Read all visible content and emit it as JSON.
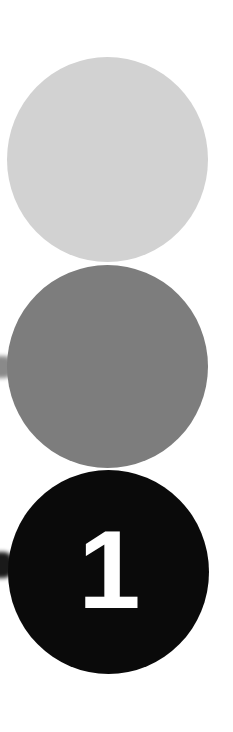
{
  "steps": [
    {
      "id": "step-light",
      "label": "",
      "color": "#d2d2d2"
    },
    {
      "id": "step-mid",
      "label": "",
      "color": "#7d7d7d"
    },
    {
      "id": "step-dark",
      "label": "1",
      "color": "#0a0a0a"
    }
  ],
  "connectors": [
    {
      "id": "connector-mid",
      "color": "#8a8a8a"
    },
    {
      "id": "connector-dark",
      "color": "#1a1a1a"
    }
  ],
  "colors": {
    "background": "#ffffff",
    "number_text": "#ffffff"
  }
}
